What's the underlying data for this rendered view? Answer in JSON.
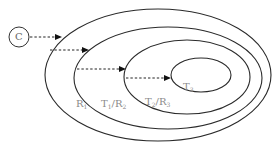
{
  "diagram": {
    "source_node": {
      "label": "C"
    },
    "regions": [
      {
        "id": "R1",
        "label_main": "R",
        "label_sub": "1"
      },
      {
        "id": "T1R2",
        "label_main_a": "T",
        "label_sub_a": "1",
        "separator": "/",
        "label_main_b": "R",
        "label_sub_b": "2"
      },
      {
        "id": "T2R3",
        "label_main_a": "T",
        "label_sub_a": "2",
        "separator": "/",
        "label_main_b": "R",
        "label_sub_b": "3"
      },
      {
        "id": "T3",
        "label_main": "T",
        "label_sub": "3"
      }
    ],
    "arrows": [
      {
        "from": "C",
        "to": "R1",
        "style": "dashed"
      },
      {
        "from": "R1",
        "to": "T1/R2",
        "style": "dashed"
      },
      {
        "from": "T1/R2",
        "to": "T2/R3",
        "style": "dashed"
      },
      {
        "from": "T2/R3",
        "to": "T3",
        "style": "dashed"
      }
    ],
    "colors": {
      "stroke": "#2a2a2a",
      "label": "#8a8a8a",
      "background": "#ffffff"
    }
  }
}
